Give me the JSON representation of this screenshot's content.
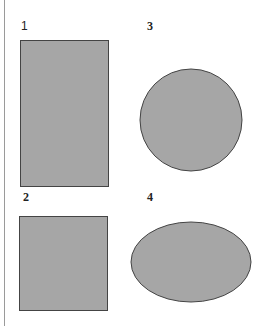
{
  "figure": {
    "shapes": [
      {
        "label": "1",
        "type": "rectangle",
        "description": "tall rectangle"
      },
      {
        "label": "2",
        "type": "square",
        "description": "square"
      },
      {
        "label": "3",
        "type": "circle",
        "description": "circle"
      },
      {
        "label": "4",
        "type": "ellipse",
        "description": "horizontal ellipse"
      }
    ],
    "fill_color": "#a6a6a6",
    "stroke_color": "#444444"
  }
}
